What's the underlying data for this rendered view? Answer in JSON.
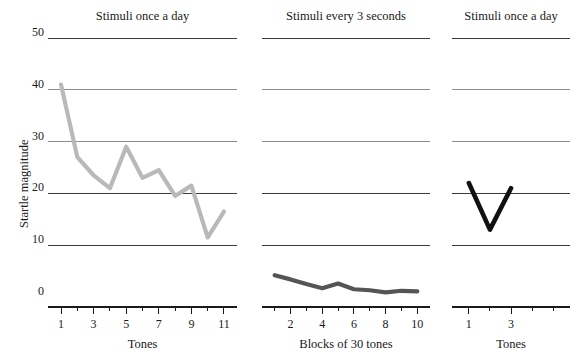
{
  "figure": {
    "background_color": "#ffffff",
    "y_axis_label": "Startle magnitude",
    "y_ticks": [
      "50",
      "40",
      "30",
      "20",
      "10",
      "0"
    ]
  },
  "chart_data": [
    {
      "type": "line",
      "title": "Stimuli once a day",
      "xlabel": "Tones",
      "ylabel": "Startle magnitude",
      "x": [
        1,
        2,
        3,
        4,
        5,
        6,
        7,
        8,
        9,
        10,
        11
      ],
      "values": [
        41,
        27,
        23.5,
        21,
        29,
        23,
        24.5,
        19.5,
        21.5,
        11.5,
        16.5
      ],
      "xtick_labels": [
        "1",
        "3",
        "5",
        "7",
        "9",
        "11"
      ],
      "xtick_values": [
        1,
        3,
        5,
        7,
        9,
        11
      ],
      "ylim": [
        0,
        50
      ],
      "xlim": [
        0.2,
        11.8
      ],
      "grid": true,
      "series_color": "#b9b9b9",
      "legend": "none"
    },
    {
      "type": "line",
      "title": "Stimuli every 3 seconds",
      "xlabel": "Blocks of 30 tones",
      "ylabel": "",
      "x": [
        1,
        2,
        3,
        4,
        5,
        6,
        7,
        8,
        9,
        10
      ],
      "values": [
        4.2,
        3.4,
        2.5,
        1.7,
        2.6,
        1.5,
        1.3,
        0.9,
        1.2,
        1.1
      ],
      "xtick_labels": [
        "2",
        "4",
        "6",
        "8",
        "10"
      ],
      "xtick_values": [
        2,
        4,
        6,
        8,
        10
      ],
      "ylim": [
        0,
        50
      ],
      "xlim": [
        0.2,
        10.8
      ],
      "grid": true,
      "series_color": "#555555",
      "legend": "none"
    },
    {
      "type": "line",
      "title": "Stimuli once a day",
      "xlabel": "Tones",
      "ylabel": "",
      "x": [
        1,
        2,
        3
      ],
      "values": [
        22,
        13,
        21
      ],
      "xtick_labels": [
        "1",
        "3"
      ],
      "xtick_values": [
        1,
        3
      ],
      "ylim": [
        0,
        50
      ],
      "xlim": [
        0.2,
        5.8
      ],
      "grid": true,
      "series_color": "#111111",
      "legend": "none"
    }
  ]
}
